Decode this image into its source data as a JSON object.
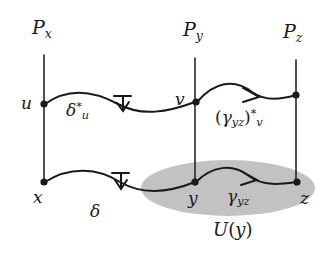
{
  "figure": {
    "type": "commutative-diagram",
    "colors": {
      "ink": "#1a1a1a",
      "background": "#ffffff",
      "region_fill": "#c9c9c9"
    }
  },
  "fibers": [
    {
      "id": "fiber-px",
      "label_base": "P",
      "label_sub": "x",
      "x": 44,
      "y_top": 55,
      "y_bottom": 184
    },
    {
      "id": "fiber-py",
      "label_base": "P",
      "label_sub": "y",
      "x": 195,
      "y_top": 58,
      "y_bottom": 185
    },
    {
      "id": "fiber-pz",
      "label_base": "P",
      "label_sub": "z",
      "x": 296,
      "y_top": 60,
      "y_bottom": 185
    }
  ],
  "nodes": [
    {
      "id": "node-u",
      "label": "u",
      "x": 44,
      "y": 104
    },
    {
      "id": "node-v",
      "label": "v",
      "x": 196,
      "y": 102
    },
    {
      "id": "node-w",
      "label": "",
      "x": 296,
      "y": 95
    },
    {
      "id": "node-x",
      "label": "x",
      "x": 44,
      "y": 182
    },
    {
      "id": "node-y",
      "label": "y",
      "x": 195,
      "y": 182
    },
    {
      "id": "node-z",
      "label": "z",
      "x": 297,
      "y": 182
    }
  ],
  "arrows": [
    {
      "id": "arrow-delta-star-u",
      "from": "node-u",
      "to": "node-v",
      "head": "flat-bar-arrow",
      "label_base": "δ",
      "label_sup": "*",
      "label_sub": "u"
    },
    {
      "id": "arrow-gamma-yz-star-v",
      "from": "node-v",
      "to": "node-w",
      "head": "v-arrow",
      "label_open": "(",
      "label_base": "γ",
      "label_base_sub": "yz",
      "label_close": ")",
      "label_sup": "*",
      "label_sub": "v"
    },
    {
      "id": "arrow-delta",
      "from": "node-x",
      "to": "node-y",
      "head": "flat-bar-arrow",
      "label_base": "δ"
    },
    {
      "id": "arrow-gamma-yz",
      "from": "node-y",
      "to": "node-z",
      "head": "v-arrow",
      "label_base": "γ",
      "label_sub": "yz"
    }
  ],
  "region": {
    "id": "region-u-of-y",
    "label_base": "U",
    "label_open": "(",
    "label_arg": "y",
    "label_close": ")",
    "cx": 228,
    "cy": 188,
    "rx": 87,
    "ry": 28
  },
  "labels": {
    "px": {
      "base": "P",
      "sub": "x"
    },
    "py": {
      "base": "P",
      "sub": "y"
    },
    "pz": {
      "base": "P",
      "sub": "z"
    },
    "u": "u",
    "v": "v",
    "x": "x",
    "y": "y",
    "z": "z",
    "delta": "δ",
    "star": "*",
    "gamma": "γ",
    "gamma_sub": "yz",
    "paren_open": "(",
    "paren_close": ")",
    "u_big": "U"
  }
}
